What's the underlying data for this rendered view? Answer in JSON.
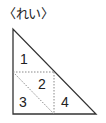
{
  "heading": "〈れい〉",
  "figure": {
    "shape": "right-triangle",
    "stroke_color": "#333333",
    "dotted_color": "#888888",
    "regions": [
      {
        "id": 1,
        "label": "1"
      },
      {
        "id": 2,
        "label": "2"
      },
      {
        "id": 3,
        "label": "3"
      },
      {
        "id": 4,
        "label": "4"
      }
    ]
  }
}
